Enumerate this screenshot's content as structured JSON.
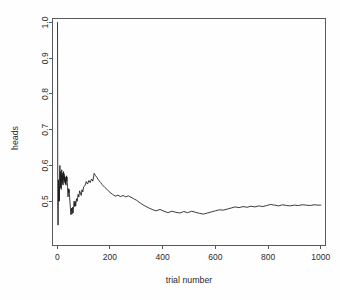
{
  "chart_data": {
    "type": "line",
    "title": "",
    "xlabel": "trial number",
    "ylabel": "heads",
    "xlim": [
      -18,
      1018
    ],
    "ylim": [
      0.3775,
      1.0111
    ],
    "grid": false,
    "legend": null,
    "xticks": [
      0,
      200,
      400,
      600,
      800,
      1000
    ],
    "xtick_labels": [
      "0",
      "200",
      "400",
      "600",
      "800",
      "1000"
    ],
    "yticks": [
      0.5,
      0.6,
      0.7,
      0.8,
      0.9,
      1.0
    ],
    "ytick_labels": [
      "0.5",
      "0.6",
      "0.7",
      "0.8",
      "0.9",
      "1.0"
    ],
    "series": [
      {
        "name": "running proportion of heads",
        "color": "#1a1a1a",
        "x": [
          1,
          2,
          3,
          4,
          5,
          6,
          7,
          8,
          9,
          10,
          11,
          12,
          13,
          14,
          15,
          16,
          17,
          18,
          19,
          20,
          21,
          22,
          23,
          24,
          25,
          26,
          27,
          28,
          29,
          30,
          31,
          32,
          33,
          34,
          35,
          36,
          37,
          38,
          39,
          40,
          41,
          42,
          43,
          44,
          45,
          46,
          47,
          48,
          49,
          50,
          52,
          54,
          56,
          58,
          60,
          62,
          64,
          66,
          68,
          70,
          73,
          76,
          79,
          82,
          85,
          88,
          91,
          94,
          97,
          100,
          105,
          110,
          115,
          120,
          125,
          130,
          135,
          140,
          145,
          150,
          155,
          160,
          165,
          170,
          175,
          180,
          190,
          200,
          210,
          220,
          230,
          240,
          250,
          260,
          270,
          280,
          290,
          300,
          315,
          330,
          345,
          360,
          375,
          390,
          405,
          420,
          435,
          450,
          465,
          480,
          495,
          510,
          525,
          540,
          555,
          570,
          585,
          600,
          615,
          630,
          645,
          660,
          675,
          690,
          705,
          720,
          735,
          750,
          765,
          780,
          795,
          810,
          825,
          840,
          855,
          870,
          885,
          900,
          915,
          930,
          945,
          960,
          975,
          990,
          1000
        ],
        "y": [
          1.0,
          0.5,
          0.433,
          0.5,
          0.56,
          0.5,
          0.543,
          0.5,
          0.556,
          0.6,
          0.545,
          0.583,
          0.538,
          0.571,
          0.533,
          0.563,
          0.588,
          0.556,
          0.579,
          0.55,
          0.571,
          0.545,
          0.565,
          0.583,
          0.56,
          0.577,
          0.556,
          0.571,
          0.552,
          0.567,
          0.548,
          0.563,
          0.545,
          0.559,
          0.571,
          0.556,
          0.568,
          0.553,
          0.538,
          0.525,
          0.512,
          0.524,
          0.535,
          0.523,
          0.533,
          0.522,
          0.511,
          0.5,
          0.49,
          0.48,
          0.462,
          0.481,
          0.464,
          0.483,
          0.467,
          0.484,
          0.5,
          0.485,
          0.5,
          0.486,
          0.507,
          0.5,
          0.519,
          0.512,
          0.529,
          0.523,
          0.516,
          0.532,
          0.526,
          0.54,
          0.543,
          0.555,
          0.548,
          0.558,
          0.552,
          0.562,
          0.556,
          0.578,
          0.572,
          0.567,
          0.561,
          0.556,
          0.552,
          0.547,
          0.543,
          0.539,
          0.532,
          0.525,
          0.519,
          0.514,
          0.517,
          0.513,
          0.516,
          0.512,
          0.515,
          0.511,
          0.507,
          0.503,
          0.495,
          0.488,
          0.482,
          0.477,
          0.473,
          0.477,
          0.472,
          0.468,
          0.472,
          0.469,
          0.467,
          0.471,
          0.468,
          0.472,
          0.469,
          0.466,
          0.464,
          0.467,
          0.47,
          0.473,
          0.476,
          0.475,
          0.478,
          0.481,
          0.484,
          0.482,
          0.485,
          0.483,
          0.486,
          0.484,
          0.487,
          0.485,
          0.488,
          0.491,
          0.489,
          0.487,
          0.49,
          0.488,
          0.487,
          0.489,
          0.488,
          0.49,
          0.489,
          0.488,
          0.49,
          0.489,
          0.489
        ]
      }
    ]
  },
  "figure": {
    "background_color": "#fefefe",
    "axis_color": "#5a5a5a",
    "text_color": "#2b2b2b"
  }
}
